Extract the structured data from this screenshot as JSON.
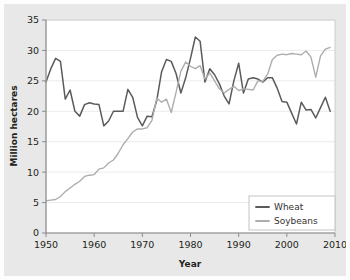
{
  "chart_data": {
    "type": "line",
    "title": "",
    "xlabel": "Year",
    "ylabel": "Million hectares",
    "xlim": [
      1950,
      2010
    ],
    "ylim": [
      0,
      35
    ],
    "xticks": [
      1950,
      1960,
      1970,
      1980,
      1990,
      2000,
      2010
    ],
    "yticks": [
      0,
      5,
      10,
      15,
      20,
      25,
      30,
      35
    ],
    "grid": "horizontal",
    "legend_position": "lower right",
    "x": [
      1950,
      1951,
      1952,
      1953,
      1954,
      1955,
      1956,
      1957,
      1958,
      1959,
      1960,
      1961,
      1962,
      1963,
      1964,
      1965,
      1966,
      1967,
      1968,
      1969,
      1970,
      1971,
      1972,
      1973,
      1974,
      1975,
      1976,
      1977,
      1978,
      1979,
      1980,
      1981,
      1982,
      1983,
      1984,
      1985,
      1986,
      1987,
      1988,
      1989,
      1990,
      1991,
      1992,
      1993,
      1994,
      1995,
      1996,
      1997,
      1998,
      1999,
      2000,
      2001,
      2002,
      2003,
      2004,
      2005,
      2006,
      2007,
      2008,
      2009
    ],
    "series": [
      {
        "name": "Wheat",
        "color": "#5b5b5b",
        "values": [
          24.8,
          27.0,
          28.7,
          28.2,
          22.0,
          23.5,
          20.0,
          19.2,
          21.1,
          21.4,
          21.2,
          21.1,
          17.6,
          18.4,
          20.0,
          20.0,
          20.0,
          23.6,
          22.3,
          19.0,
          17.6,
          19.2,
          19.1,
          21.8,
          26.5,
          28.5,
          28.2,
          26.2,
          23.0,
          25.5,
          28.7,
          32.2,
          31.5,
          24.8,
          27.0,
          26.0,
          24.5,
          22.5,
          21.2,
          25.0,
          27.9,
          23.0,
          25.3,
          25.5,
          25.3,
          24.8,
          25.5,
          25.5,
          23.8,
          21.6,
          21.5,
          19.7,
          17.9,
          21.5,
          20.2,
          20.3,
          18.9,
          20.6,
          22.3,
          20.0
        ]
      },
      {
        "name": "Soybeans",
        "color": "#adadad",
        "values": [
          5.3,
          5.4,
          5.5,
          6.0,
          6.8,
          7.4,
          8.0,
          8.5,
          9.3,
          9.5,
          9.6,
          10.5,
          10.7,
          11.5,
          12.0,
          13.1,
          14.5,
          15.5,
          16.6,
          17.1,
          17.1,
          17.3,
          18.5,
          22.2,
          21.5,
          22.0,
          19.8,
          23.1,
          26.6,
          28.1,
          27.4,
          27.0,
          27.5,
          25.3,
          26.3,
          25.0,
          23.7,
          23.0,
          23.6,
          24.1,
          23.4,
          23.7,
          23.6,
          23.5,
          25.0,
          24.9,
          26.1,
          28.5,
          29.2,
          29.4,
          29.3,
          29.5,
          29.4,
          29.3,
          29.9,
          28.9,
          25.6,
          29.1,
          30.2,
          30.5
        ]
      }
    ],
    "legend": [
      {
        "label": "Wheat",
        "color": "#5b5b5b"
      },
      {
        "label": "Soybeans",
        "color": "#adadad"
      }
    ]
  }
}
